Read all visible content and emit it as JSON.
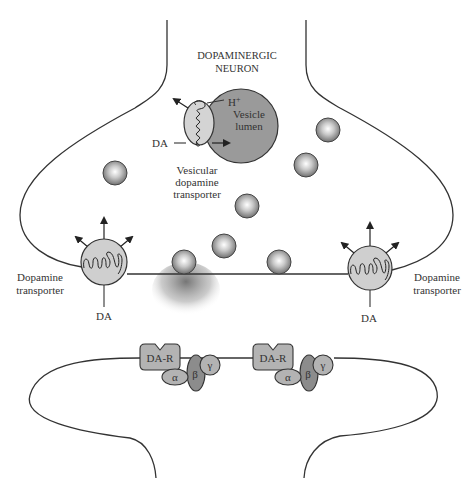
{
  "diagram": {
    "title_line1": "DOPAMINERGIC",
    "title_line2": "NEURON",
    "vesicle": {
      "h_label": "H",
      "h_sup": "+",
      "lumen_line1": "Vesicle",
      "lumen_line2": "lumen",
      "da_label": "DA",
      "vmat_line1": "Vesicular",
      "vmat_line2": "dopamine",
      "vmat_line3": "transporter"
    },
    "left_transporter": {
      "label_line1": "Dopamine",
      "label_line2": "transporter",
      "da_label": "DA"
    },
    "right_transporter": {
      "label_line1": "Dopamine",
      "label_line2": "transporter",
      "da_label": "DA"
    },
    "receptors": [
      {
        "label": "DA-R",
        "alpha": "α",
        "beta": "β",
        "gamma": "γ"
      },
      {
        "label": "DA-R",
        "alpha": "α",
        "beta": "β",
        "gamma": "γ"
      }
    ],
    "colors": {
      "outline": "#333333",
      "vesicle_lumen": "#9a9a9a",
      "transporter_fill": "#cfcfcf",
      "receptor_fill": "#b3b3b3",
      "beta_fill": "#8c8c8c"
    }
  }
}
